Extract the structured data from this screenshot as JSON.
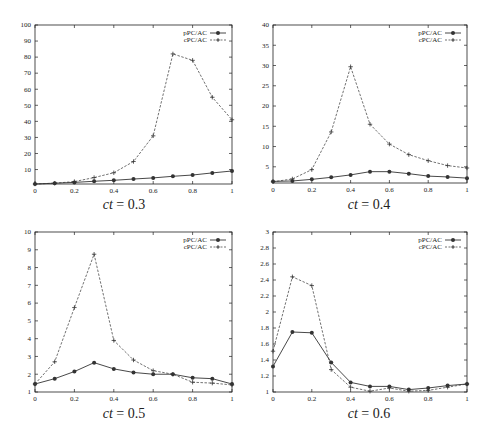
{
  "figure": {
    "panels": [
      {
        "caption_var": "ct",
        "caption_eq": " = 0.3"
      },
      {
        "caption_var": "ct",
        "caption_eq": " = 0.4"
      },
      {
        "caption_var": "ct",
        "caption_eq": " = 0.5"
      },
      {
        "caption_var": "ct",
        "caption_eq": " = 0.6"
      }
    ],
    "legend": [
      "pPC/AC",
      "cPC/AC"
    ],
    "colors": {
      "line": "#333333",
      "axis": "#222222",
      "background": "#ffffff"
    }
  },
  "chart_data": [
    {
      "type": "line",
      "title": "ct = 0.3",
      "xlabel": "",
      "ylabel": "",
      "x": [
        0,
        0.1,
        0.2,
        0.3,
        0.4,
        0.5,
        0.6,
        0.7,
        0.8,
        0.9,
        1.0
      ],
      "xlim": [
        0,
        1
      ],
      "ylim": [
        1,
        100
      ],
      "xticks": [
        "0",
        "0.2",
        "0.4",
        "0.6",
        "0.8",
        "1"
      ],
      "yticks": [
        "10",
        "20",
        "30",
        "40",
        "50",
        "60",
        "70",
        "80",
        "90",
        "100"
      ],
      "ytick_values": [
        10,
        20,
        30,
        40,
        50,
        60,
        70,
        80,
        90,
        100
      ],
      "grid": false,
      "legend_position": "top-right",
      "series": [
        {
          "name": "pPC/AC",
          "style": "solid",
          "marker": "diamond",
          "values": [
            1.0,
            1.5,
            2.0,
            2.7,
            3.3,
            4.1,
            4.8,
            5.8,
            6.6,
            7.9,
            9.1
          ]
        },
        {
          "name": "cPC/AC",
          "style": "dashed",
          "marker": "plus",
          "values": [
            1.0,
            1.5,
            2.5,
            5.0,
            8.0,
            15.0,
            31.0,
            82.0,
            78.0,
            55.0,
            41.0
          ]
        }
      ]
    },
    {
      "type": "line",
      "title": "ct = 0.4",
      "xlabel": "",
      "ylabel": "",
      "x": [
        0,
        0.1,
        0.2,
        0.3,
        0.4,
        0.5,
        0.6,
        0.7,
        0.8,
        0.9,
        1.0
      ],
      "xlim": [
        0,
        1
      ],
      "ylim": [
        1,
        40
      ],
      "xticks": [
        "0",
        "0.2",
        "0.4",
        "0.6",
        "0.8",
        "1"
      ],
      "yticks": [
        "5",
        "10",
        "15",
        "20",
        "25",
        "30",
        "35",
        "40"
      ],
      "ytick_values": [
        5,
        10,
        15,
        20,
        25,
        30,
        35,
        40
      ],
      "grid": false,
      "legend_position": "top-right",
      "series": [
        {
          "name": "pPC/AC",
          "style": "solid",
          "marker": "diamond",
          "values": [
            1.4,
            1.5,
            1.9,
            2.4,
            3.0,
            3.8,
            3.8,
            3.3,
            2.7,
            2.5,
            2.2
          ]
        },
        {
          "name": "cPC/AC",
          "style": "dashed",
          "marker": "plus",
          "values": [
            1.3,
            2.0,
            4.3,
            13.6,
            29.7,
            15.5,
            10.6,
            8.0,
            6.5,
            5.3,
            4.7
          ]
        }
      ]
    },
    {
      "type": "line",
      "title": "ct = 0.5",
      "xlabel": "",
      "ylabel": "",
      "x": [
        0,
        0.1,
        0.2,
        0.3,
        0.4,
        0.5,
        0.6,
        0.7,
        0.8,
        0.9,
        1.0
      ],
      "xlim": [
        0,
        1
      ],
      "ylim": [
        1,
        10
      ],
      "xticks": [
        "0",
        "0.2",
        "0.4",
        "0.6",
        "0.8",
        "1"
      ],
      "yticks": [
        "1",
        "2",
        "3",
        "4",
        "5",
        "6",
        "7",
        "8",
        "9",
        "10"
      ],
      "ytick_values": [
        1,
        2,
        3,
        4,
        5,
        6,
        7,
        8,
        9,
        10
      ],
      "grid": false,
      "legend_position": "top-right",
      "series": [
        {
          "name": "pPC/AC",
          "style": "solid",
          "marker": "diamond",
          "values": [
            1.45,
            1.75,
            2.15,
            2.65,
            2.3,
            2.1,
            2.0,
            2.0,
            1.8,
            1.75,
            1.45
          ]
        },
        {
          "name": "cPC/AC",
          "style": "dashed",
          "marker": "plus",
          "values": [
            1.45,
            2.7,
            5.75,
            8.75,
            3.9,
            2.8,
            2.2,
            2.0,
            1.55,
            1.5,
            1.4
          ]
        }
      ]
    },
    {
      "type": "line",
      "title": "ct = 0.6",
      "xlabel": "",
      "ylabel": "",
      "x": [
        0,
        0.1,
        0.2,
        0.3,
        0.4,
        0.5,
        0.6,
        0.7,
        0.8,
        0.9,
        1.0
      ],
      "xlim": [
        0,
        1
      ],
      "ylim": [
        1,
        3
      ],
      "xticks": [
        "0",
        "0.2",
        "0.4",
        "0.6",
        "0.8",
        "1"
      ],
      "yticks": [
        "1",
        "1.2",
        "1.4",
        "1.6",
        "1.8",
        "2",
        "2.2",
        "2.4",
        "2.6",
        "2.8",
        "3"
      ],
      "ytick_values": [
        1,
        1.2,
        1.4,
        1.6,
        1.8,
        2,
        2.2,
        2.4,
        2.6,
        2.8,
        3
      ],
      "grid": false,
      "legend_position": "top-right",
      "series": [
        {
          "name": "pPC/AC",
          "style": "solid",
          "marker": "diamond",
          "values": [
            1.32,
            1.75,
            1.74,
            1.37,
            1.12,
            1.07,
            1.07,
            1.03,
            1.05,
            1.08,
            1.1
          ]
        },
        {
          "name": "cPC/AC",
          "style": "dashed",
          "marker": "plus",
          "values": [
            1.51,
            2.44,
            2.33,
            1.28,
            1.06,
            1.01,
            1.05,
            1.01,
            1.02,
            1.06,
            1.1
          ]
        }
      ]
    }
  ]
}
